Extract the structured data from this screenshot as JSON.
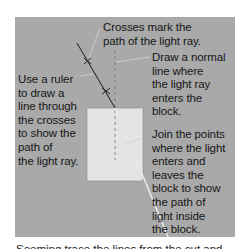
{
  "diagram": {
    "labels": {
      "crosses": "Crosses mark the\npath of the light ray.",
      "normal": "Draw a normal\nline where\nthe light ray\nenters the\nblock.",
      "ruler": "Use a ruler\nto draw a\nline through\nthe crosses\nto show the\npath of\nthe light ray.",
      "join": "Join the points\nwhere the light\nenters and\nleaves the\nblock to show\nthe path of\nlight inside\nthe block."
    },
    "bottom_text_cut": "Seeming trace the lines from the cut and",
    "colors": {
      "panel": "#a9a9a9",
      "block": "#e4e4e4",
      "ray": "#1a1a1a",
      "ray_inside": "#d8d8d8",
      "normal": "#7a7a7a",
      "leader": "#d0d0d0"
    }
  }
}
